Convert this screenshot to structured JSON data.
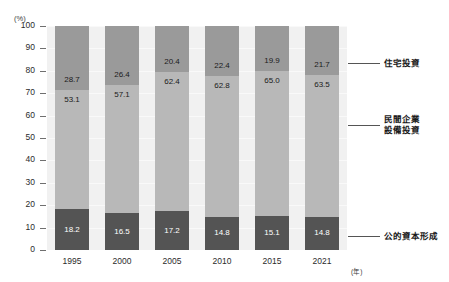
{
  "chart_data": {
    "type": "bar",
    "subtype": "stacked-100-percent",
    "title": "",
    "xlabel": "(年)",
    "ylabel": "(%)",
    "categories": [
      "1995",
      "2000",
      "2005",
      "2010",
      "2015",
      "2021"
    ],
    "ylim": [
      0,
      100
    ],
    "yticks": [
      0,
      10,
      20,
      30,
      40,
      50,
      60,
      70,
      80,
      90,
      100
    ],
    "ytick_labels": [
      "0",
      "10",
      "20",
      "30",
      "40",
      "50",
      "60",
      "70",
      "80",
      "90",
      "100"
    ],
    "grid": true,
    "legend_position": "right",
    "series": [
      {
        "name": "公的資本形成",
        "color": "#545454",
        "stack_order": 0,
        "values": [
          18.2,
          16.5,
          17.2,
          14.8,
          15.1,
          14.8
        ],
        "labels": [
          "18.2",
          "16.5",
          "17.2",
          "14.8",
          "15.1",
          "14.8"
        ]
      },
      {
        "name": "民間企業設備投資",
        "name_line1": "民間企業",
        "name_line2": "設備投資",
        "color": "#b8b8b8",
        "stack_order": 1,
        "values": [
          53.1,
          57.1,
          62.4,
          62.8,
          65.0,
          63.5
        ],
        "labels": [
          "53.1",
          "57.1",
          "62.4",
          "62.8",
          "65.0",
          "63.5"
        ]
      },
      {
        "name": "住宅投資",
        "color": "#9a9a9a",
        "stack_order": 2,
        "values": [
          28.7,
          26.4,
          20.4,
          22.4,
          19.9,
          21.7
        ],
        "labels": [
          "28.7",
          "26.4",
          "20.4",
          "22.4",
          "19.9",
          "21.7"
        ]
      }
    ]
  },
  "axis": {
    "y_unit": "(%)",
    "x_unit": "(年)"
  },
  "legend": {
    "items": [
      {
        "label": "住宅投資",
        "line2": ""
      },
      {
        "label": "民間企業",
        "line2": "設備投資"
      },
      {
        "label": "公的資本形成",
        "line2": ""
      }
    ]
  },
  "colors": {
    "housing": "#9a9a9a",
    "private_equipment": "#b8b8b8",
    "public_capital": "#545454",
    "plot_background": "#f1f1f1",
    "page_background": "#ffffff"
  }
}
